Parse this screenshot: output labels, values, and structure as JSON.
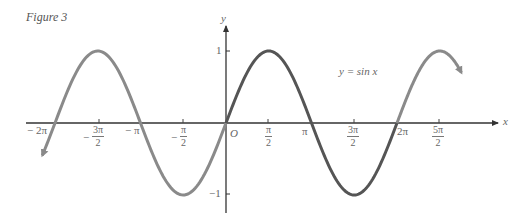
{
  "figure": {
    "title": "Figure 3",
    "equation": "y = sin x",
    "x_axis_label": "x",
    "y_axis_label": "y",
    "origin_label": "O",
    "y_ticks": [
      {
        "label": "1"
      },
      {
        "label": "−1"
      }
    ],
    "x_ticks": {
      "m2pi": "− 2π",
      "m3pi2_num": "3π",
      "m3pi2_den": "2",
      "m3pi2_sign": "−",
      "mpi": "− π",
      "mpi2_num": "π",
      "mpi2_den": "2",
      "mpi2_sign": "−",
      "pi2_num": "π",
      "pi2_den": "2",
      "pi": "π",
      "p3pi2_num": "3π",
      "p3pi2_den": "2",
      "p2pi": "2π",
      "p5pi2_num": "5π",
      "p5pi2_den": "2"
    }
  },
  "chart_data": {
    "type": "line",
    "title": "Figure 3",
    "function": "y = sin x",
    "xlabel": "x",
    "ylabel": "y",
    "xlim": [
      -6.6,
      8.6
    ],
    "ylim": [
      -1.3,
      1.3
    ],
    "x_tick_labels": [
      "−2π",
      "−3π/2",
      "−π",
      "−π/2",
      "O",
      "π/2",
      "π",
      "3π/2",
      "2π",
      "5π/2"
    ],
    "x_tick_values": [
      -6.283,
      -4.712,
      -3.142,
      -1.571,
      0,
      1.571,
      3.142,
      4.712,
      6.283,
      7.854
    ],
    "y_tick_labels": [
      "1",
      "−1"
    ],
    "y_tick_values": [
      1,
      -1
    ],
    "series": [
      {
        "name": "sin x (x < 0)",
        "color": "#8a8a8a",
        "x": [
          -6.6,
          -6.283,
          -4.712,
          -3.142,
          -1.571,
          0
        ],
        "y": [
          -0.31,
          0,
          1,
          0,
          -1,
          0
        ]
      },
      {
        "name": "sin x (one period 0 to 2π)",
        "color": "#555555",
        "x": [
          0,
          1.571,
          3.142,
          4.712,
          6.283
        ],
        "y": [
          0,
          1,
          0,
          -1,
          0
        ]
      },
      {
        "name": "sin x (x > 2π)",
        "color": "#8a8a8a",
        "x": [
          6.283,
          7.854,
          8.6
        ],
        "y": [
          0,
          1,
          0.73
        ]
      }
    ],
    "grid": false,
    "legend": "none"
  }
}
